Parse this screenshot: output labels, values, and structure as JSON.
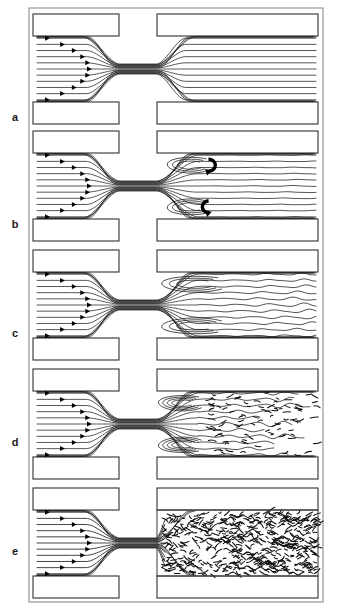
{
  "figure": {
    "width": 339,
    "height": 611,
    "background_color": "#ffffff",
    "line_color": "#151515",
    "wall_color": "#3a3a3a",
    "frame_color": "#8d8d8d"
  },
  "frame": {
    "x": 29,
    "y": 8,
    "width": 294,
    "height": 594
  },
  "geometry": {
    "panel_left": 33,
    "panel_right": 318,
    "channel_inner_left": 36,
    "wall_thickness": 22,
    "throat_left": 120,
    "throat_right": 156,
    "throat_half_height": 5,
    "upstream_wall_right": 119,
    "downstream_wall_left": 157,
    "streamline_count": 11,
    "inlet_arrow_count": 11
  },
  "panels": [
    {
      "id": "a",
      "label": "a",
      "label_x": 15,
      "label_y": 121,
      "top": 14,
      "height": 110,
      "regime": "laminar",
      "description": "Fully laminar flow: smooth parallel streamlines converge into the throat and re-expand without separation.",
      "has_vortices": false,
      "has_rotation_arrows": false,
      "wake_type": "parallel",
      "downstream_spread": 0.0,
      "turbulence_density": 0
    },
    {
      "id": "b",
      "label": "b",
      "label_x": 15,
      "label_y": 228,
      "top": 131,
      "height": 110,
      "regime": "steady-recirculation",
      "description": "Two steady symmetric recirculation eddies form in the corners downstream of the constriction; the jet core remains straight.",
      "has_vortices": true,
      "has_rotation_arrows": true,
      "vortex_count": 2,
      "wake_type": "jet-with-eddies",
      "downstream_spread": 0.12,
      "turbulence_density": 0
    },
    {
      "id": "c",
      "label": "c",
      "label_x": 15,
      "label_y": 337,
      "top": 250,
      "height": 110,
      "regime": "transitional-wavy",
      "description": "The eddies elongate and the emerging jet begins to waver; streamlines downstream become wavy but remain continuous.",
      "has_vortices": true,
      "has_rotation_arrows": false,
      "vortex_count": 2,
      "wake_type": "wavy-jet",
      "downstream_spread": 0.45,
      "turbulence_density": 0
    },
    {
      "id": "d",
      "label": "d",
      "label_x": 15,
      "label_y": 446,
      "top": 369,
      "height": 110,
      "regime": "transition-to-turbulence",
      "description": "The jet breaks down: coherent streamlines give way to broken, irregular filaments while tight corner vortices persist.",
      "has_vortices": true,
      "has_rotation_arrows": false,
      "vortex_count": 2,
      "wake_type": "breaking-jet",
      "downstream_spread": 0.8,
      "turbulence_density": 90
    },
    {
      "id": "e",
      "label": "e",
      "label_x": 15,
      "label_y": 555,
      "top": 488,
      "height": 110,
      "regime": "fully-turbulent",
      "description": "Fully turbulent downstream region filled with small-scale chaotic eddies; the inlet flow remains laminar.",
      "has_vortices": false,
      "has_rotation_arrows": false,
      "wake_type": "turbulent",
      "downstream_spread": 1.0,
      "turbulence_density": 460
    }
  ],
  "annotations": {
    "inlet_arrow_note": "Arrowheads along the inlet streamlines trace a parabolic velocity profile, farthest downstream at the channel centreline.",
    "rotation_arrow_note": "Thick curved arrows in panel b mark the rotation sense of the separation eddies."
  }
}
